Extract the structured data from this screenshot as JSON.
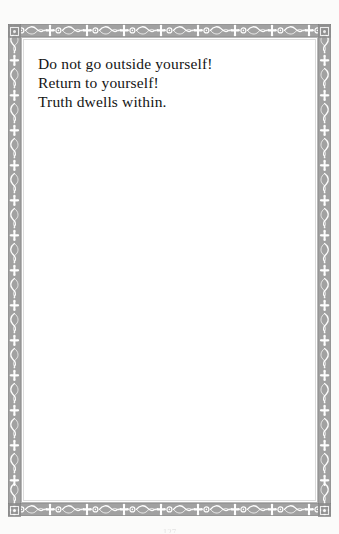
{
  "page": {
    "kind": "scanned-book-page",
    "width": 339,
    "height": 534,
    "background_color": "#fdfdfd",
    "paper_color": "#ffffff"
  },
  "frame": {
    "name": "ornamental-border",
    "ink_color": "#8e8e8e",
    "highlight_color": "#ffffff",
    "inner_rule_color": "#b7b7b7",
    "motifs": [
      "fleur-de-lis-cross",
      "small-circle",
      "s-scroll"
    ],
    "repeat_width_px": 37
  },
  "content": {
    "verse_lines": [
      "Do not go outside yourself!",
      "Return to yourself!",
      "Truth dwells within."
    ]
  },
  "footer": {
    "page_number": "127"
  }
}
